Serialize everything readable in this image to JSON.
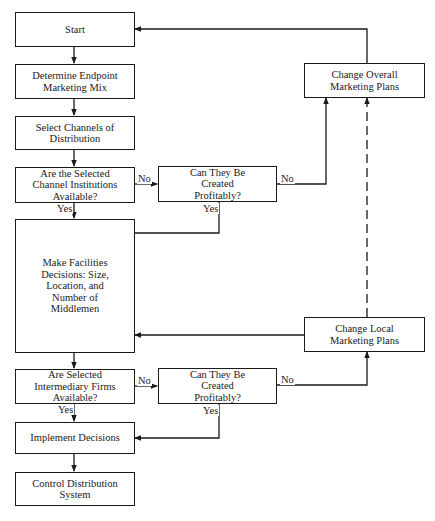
{
  "diagram": {
    "type": "flowchart",
    "nodes": {
      "start": "Start",
      "endpoint_mix": "Determine Endpoint Marketing Mix",
      "select_channels": "Select Channels of Distribution",
      "institutions_available": "Are the Selected Channel Institutions Available?",
      "create_profitably_1": "Can They Be Created Profitably?",
      "change_overall": "Change Overall Marketing Plans",
      "facilities": "Make Facilities Decisions: Size, Location, and Number of Middlemen",
      "change_local": "Change Local Marketing Plans",
      "firms_available": "Are Selected Intermediary Firms Available?",
      "create_profitably_2": "Can They Be Created Profitably?",
      "implement": "Implement Decisions",
      "control": "Control Distribution System"
    },
    "labels": {
      "no": "No",
      "yes": "Yes"
    },
    "edges": [
      {
        "from": "start",
        "to": "endpoint_mix"
      },
      {
        "from": "endpoint_mix",
        "to": "select_channels"
      },
      {
        "from": "select_channels",
        "to": "institutions_available"
      },
      {
        "from": "institutions_available",
        "to": "create_profitably_1",
        "label": "No"
      },
      {
        "from": "institutions_available",
        "to": "facilities",
        "label": "Yes"
      },
      {
        "from": "create_profitably_1",
        "to": "change_overall",
        "label": "No"
      },
      {
        "from": "create_profitably_1",
        "to": "facilities",
        "label": "Yes"
      },
      {
        "from": "change_overall",
        "to": "start"
      },
      {
        "from": "change_local",
        "to": "change_overall",
        "style": "dashed"
      },
      {
        "from": "change_local",
        "to": "facilities"
      },
      {
        "from": "facilities",
        "to": "firms_available"
      },
      {
        "from": "firms_available",
        "to": "create_profitably_2",
        "label": "No"
      },
      {
        "from": "firms_available",
        "to": "implement",
        "label": "Yes"
      },
      {
        "from": "create_profitably_2",
        "to": "change_local",
        "label": "No"
      },
      {
        "from": "create_profitably_2",
        "to": "implement",
        "label": "Yes"
      },
      {
        "from": "implement",
        "to": "control"
      }
    ]
  }
}
